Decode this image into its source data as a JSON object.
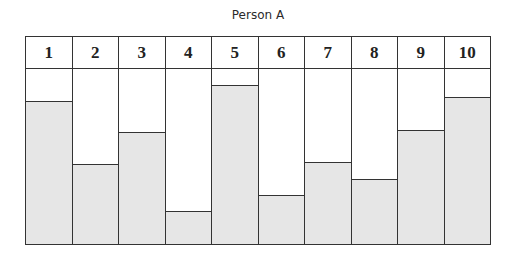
{
  "chart_data": {
    "type": "bar",
    "title": "Person A",
    "categories": [
      "1",
      "2",
      "3",
      "4",
      "5",
      "6",
      "7",
      "8",
      "9",
      "10"
    ],
    "values": [
      82,
      46,
      64,
      19,
      91,
      28,
      47,
      37,
      65,
      84
    ],
    "xlabel": "",
    "ylabel": "",
    "ylim": [
      0,
      100
    ],
    "grid": false,
    "legend": null,
    "fill_color": "#e6e6e6",
    "border_color": "#333333"
  }
}
